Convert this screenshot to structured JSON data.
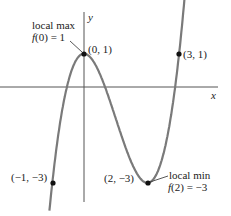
{
  "chart_data": {
    "type": "line",
    "title": "",
    "function": "f(x) = x^3 - 3x^2 + 1",
    "xlabel": "x",
    "ylabel": "y",
    "xlim": [
      -1.1,
      3.3
    ],
    "ylim": [
      -3.6,
      2.7
    ],
    "grid": false,
    "points": [
      {
        "x": -1,
        "y": -3,
        "label": "(−1, −3)"
      },
      {
        "x": 0,
        "y": 1,
        "label": "(0, 1)"
      },
      {
        "x": 2,
        "y": -3,
        "label": "(2, −3)"
      },
      {
        "x": 3,
        "y": 1,
        "label": "(3, 1)"
      }
    ],
    "annotations": [
      {
        "at": "(0, 1)",
        "line1": "local max",
        "line2": "f(0) = 1"
      },
      {
        "at": "(2, −3)",
        "line1": "local min",
        "line2": "f(2) = −3"
      }
    ],
    "colors": {
      "curve": "#777777",
      "axes": "#555555",
      "points": "#111111"
    }
  },
  "labels": {
    "x_axis": "x",
    "y_axis": "y",
    "p_max": "(0, 1)",
    "p_31": "(3, 1)",
    "p_m1": "(−1, −3)",
    "p_min": "(2, −3)",
    "max_l1": "local max",
    "max_l2": "f(0) = 1",
    "min_l1": "local min",
    "min_l2": "f(2) = −3"
  }
}
